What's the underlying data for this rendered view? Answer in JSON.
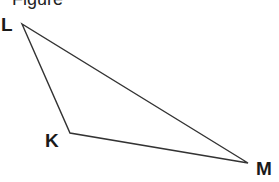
{
  "caption": "Figure",
  "triangle": {
    "vertices": [
      {
        "label": "L",
        "x": 22,
        "y": 24
      },
      {
        "label": "K",
        "x": 70,
        "y": 133
      },
      {
        "label": "M",
        "x": 248,
        "y": 163
      }
    ],
    "stroke_color": "#333333"
  },
  "labels": {
    "L": "L",
    "K": "K",
    "M": "M"
  }
}
